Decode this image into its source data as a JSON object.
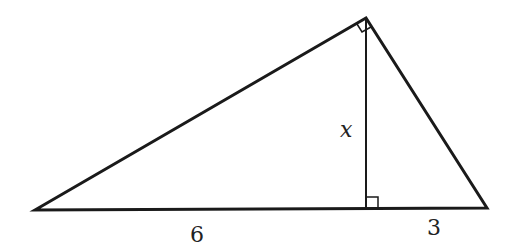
{
  "diagram": {
    "type": "right-triangle-with-altitude",
    "stroke_color": "#1a1a1a",
    "vertices": {
      "left": [
        35,
        210
      ],
      "top": [
        366,
        18
      ],
      "right": [
        487,
        208
      ],
      "altitude_foot": [
        366,
        209
      ]
    },
    "labels": {
      "altitude": "x",
      "left_segment": "6",
      "right_segment": "3"
    },
    "right_angle_marks": [
      "at top vertex between two sides",
      "at foot of altitude"
    ]
  }
}
